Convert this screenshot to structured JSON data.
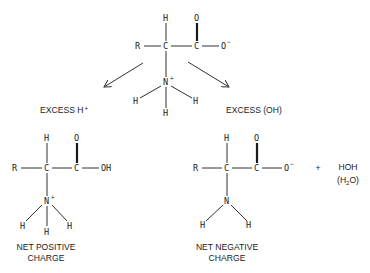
{
  "top_molecule": {
    "name": "zwitterion",
    "atoms": {
      "r": "R",
      "c_alpha": "C",
      "c_carboxyl": "C",
      "o_minus": "O",
      "o_minus_charge": "−",
      "h_top": "H",
      "o_top": "O",
      "n": "N",
      "n_charge": "+",
      "h_left": "H",
      "h_right": "H",
      "h_bottom": "H"
    }
  },
  "arrows": [
    {
      "direction": "left",
      "label": "EXCESS H",
      "label_sup": "+"
    },
    {
      "direction": "right",
      "label": "EXCESS (OH)"
    }
  ],
  "labels": {
    "excess_h": "EXCESS H",
    "excess_h_sup": "+",
    "excess_oh": "EXCESS (OH)"
  },
  "left_molecule": {
    "atoms": {
      "r": "R",
      "c_alpha": "C",
      "c_carboxyl": "C",
      "oh": "OH",
      "h_top": "H",
      "o_top": "O",
      "n": "N",
      "n_charge": "+",
      "h_left": "H",
      "h_right": "H",
      "h_bottom": "H"
    },
    "caption_line1": "NET POSITIVE",
    "caption_line2": "CHARGE"
  },
  "right_molecule": {
    "atoms": {
      "r": "R",
      "c_alpha": "C",
      "c_carboxyl": "C",
      "o_minus": "O",
      "o_minus_charge": "−",
      "h_top": "H",
      "o_top": "O",
      "n": "N",
      "h_left": "H",
      "h_right": "H"
    },
    "caption_line1": "NET NEGATIVE",
    "caption_line2": "CHARGE"
  },
  "byproduct": {
    "plus": "+",
    "formula": "HOH",
    "alt_open": "(H",
    "alt_sub": "2",
    "alt_close": "O)"
  }
}
